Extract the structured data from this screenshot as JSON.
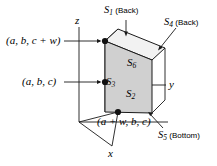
{
  "figure": {
    "background_color": "#ffffff",
    "line_color": "#1a1a1a"
  },
  "axes": {
    "z": {
      "label": "z"
    },
    "y": {
      "label": "y"
    },
    "x": {
      "label": "x"
    }
  },
  "corner_labels": {
    "top_left": "(a, b, c + w)",
    "mid_left": "(a, b, c)",
    "bottom": "(a + w, b, c)"
  },
  "faces": {
    "top": {
      "label_sym": "S",
      "label_sub": "6",
      "color": "#f2f2f2"
    },
    "front": {
      "label_sym": "S",
      "label_sub": "2",
      "color": "#d0d0d0"
    },
    "left": {
      "label_sym": "S",
      "label_sub": "3",
      "color": "#8a8a8a"
    }
  },
  "side_labels": {
    "s1": {
      "sym": "S",
      "sub": "1",
      "paren": "(Back)"
    },
    "s4": {
      "sym": "S",
      "sub": "4",
      "paren": "(Back)"
    },
    "s5": {
      "sym": "S",
      "sub": "5",
      "paren": "(Bottom)"
    }
  }
}
